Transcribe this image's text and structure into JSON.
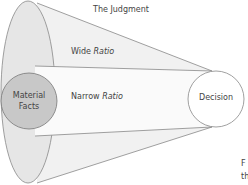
{
  "title": "The Judgment",
  "labels": {
    "wide": "Wide",
    "narrow": "Narrow",
    "ratio": "Ratio",
    "material_line1": "Material",
    "material_line2": "Facts",
    "decision": "Decision",
    "cut_text_1": "F",
    "cut_text_2": "th"
  },
  "colors": {
    "outer_fill": "#ececec",
    "inner_fill": "#c9c9c9",
    "stroke": "#888888"
  }
}
